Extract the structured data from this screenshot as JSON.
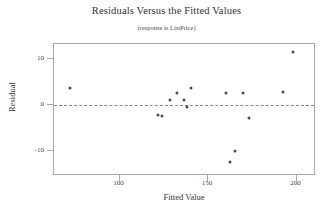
{
  "chart_data": {
    "type": "scatter",
    "title": "Residuals Versus the Fitted Values",
    "subtitle": "(response is ListPrice)",
    "xlabel": "Fitted Value",
    "ylabel": "Residual",
    "xlim": [
      63,
      211
    ],
    "ylim": [
      -15.5,
      13.3
    ],
    "xticks": [
      100,
      150,
      200
    ],
    "xtick_labels": [
      "100",
      "150",
      "200"
    ],
    "yticks": [
      10,
      0,
      -10
    ],
    "ytick_labels": [
      "10",
      "0",
      "-10"
    ],
    "grid": false,
    "legend": "none",
    "reference_line": {
      "orientation": "horizontal",
      "value": 0,
      "style": "dashed"
    },
    "points": [
      {
        "x": 72.0,
        "y": 3.6
      },
      {
        "x": 122.0,
        "y": -2.1
      },
      {
        "x": 124.2,
        "y": -2.5
      },
      {
        "x": 128.5,
        "y": 1.0
      },
      {
        "x": 132.2,
        "y": 2.6
      },
      {
        "x": 136.3,
        "y": 1.1
      },
      {
        "x": 138.0,
        "y": -0.5
      },
      {
        "x": 140.3,
        "y": 3.6
      },
      {
        "x": 160.0,
        "y": 2.6
      },
      {
        "x": 169.5,
        "y": 2.6
      },
      {
        "x": 173.0,
        "y": -2.9
      },
      {
        "x": 165.0,
        "y": -10.1
      },
      {
        "x": 162.5,
        "y": -12.4
      },
      {
        "x": 192.5,
        "y": 2.8
      },
      {
        "x": 198.0,
        "y": 11.6
      }
    ]
  }
}
